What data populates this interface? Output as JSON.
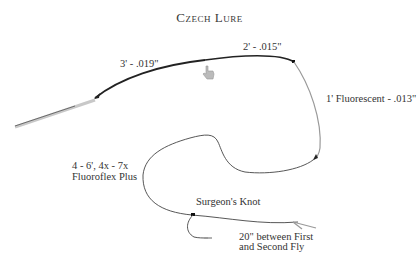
{
  "title": "Czech Lure",
  "labels": {
    "butt_section": "3' - .019\"",
    "mid_section": "2' - .015\"",
    "indicator_section": "1' Fluorescent - .013\"",
    "tippet_line1": "4 - 6', 4x - 7x",
    "tippet_line2": "Fluoroflex Plus",
    "knot": "Surgeon's Knot",
    "dropper_line1": "20\" between First",
    "dropper_line2": "and Second Fly"
  },
  "colors": {
    "heavy_line": "#222222",
    "fluorescent_line": "#999999",
    "tippet_line": "#444444",
    "fly_line": "#bbbbbb"
  }
}
